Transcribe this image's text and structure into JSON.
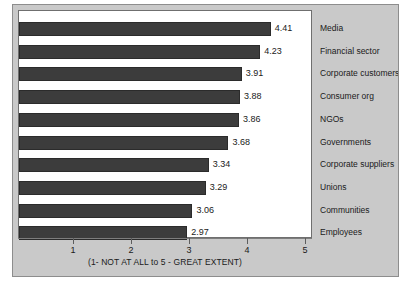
{
  "chart_data": {
    "type": "bar",
    "orientation": "horizontal",
    "title": "",
    "subtitle": "",
    "xlabel": "(1- NOT AT ALL to 5 - GREAT EXTENT)",
    "ylabel": "",
    "categories": [
      "Media",
      "Financial sector",
      "Corporate customers",
      "Consumer org",
      "NGOs",
      "Governments",
      "Corporate suppliers",
      "Unions",
      "Communities",
      "Employees"
    ],
    "values": [
      4.41,
      4.23,
      3.91,
      3.88,
      3.86,
      3.68,
      3.34,
      3.29,
      3.06,
      2.97
    ],
    "value_labels": [
      "4.41",
      "4.23",
      "3.91",
      "3.88",
      "3.86",
      "3.68",
      "3.34",
      "3.29",
      "3.06",
      "2.97"
    ],
    "xlim": [
      0,
      5
    ],
    "xticks": [
      1,
      2,
      3,
      4,
      5
    ],
    "xtick_labels": [
      "1",
      "2",
      "3",
      "4",
      "5"
    ],
    "grid": false,
    "legend_position": "right",
    "colors": {
      "bar_fill": "#3c3c3c",
      "bar_border": "#2b2b2b",
      "plot_background": "#ffffff",
      "panel_background": "#c9c9c9",
      "frame_border": "#8d8d8d",
      "axis_line": "#7d7d7d",
      "text": "#1a1a1a"
    }
  }
}
